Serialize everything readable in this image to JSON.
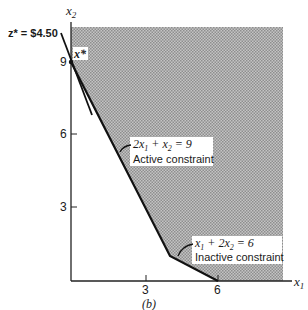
{
  "figure": {
    "caption": "(b)",
    "axes": {
      "x_label": "x",
      "x_label_sub": "1",
      "y_label": "x",
      "y_label_sub": "2",
      "x_ticks": [
        "3",
        "6"
      ],
      "y_ticks": [
        "3",
        "6",
        "9"
      ]
    },
    "objective": {
      "label": "z* = $4.50"
    },
    "optimum": {
      "label": "x*"
    },
    "constraints": [
      {
        "equation_parts": [
          "2x",
          "1",
          " + x",
          "2",
          " = 9"
        ],
        "status": "Active constraint"
      },
      {
        "equation_parts": [
          "x",
          "1",
          " + 2x",
          "2",
          " = 6"
        ],
        "status": "Inactive constraint"
      }
    ],
    "colors": {
      "feasible_fill": "#a8a8a8",
      "line": "#111111"
    }
  }
}
